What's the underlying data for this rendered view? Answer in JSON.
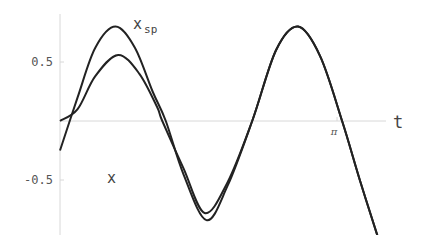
{
  "chart_data": {
    "type": "line",
    "title": "",
    "xlabel": "t",
    "ylabel": "",
    "xlim": [
      0,
      3.6
    ],
    "ylim": [
      -0.9,
      0.85
    ],
    "grid": false,
    "legend": "inline labels",
    "x_ticks": [
      {
        "value": 3.14159,
        "label": "π"
      }
    ],
    "y_ticks": [
      {
        "value": 0.5,
        "label": "0.5"
      },
      {
        "value": -0.5,
        "label": "-0.5"
      }
    ],
    "series": [
      {
        "name": "x_sp",
        "label_main": "x",
        "label_sub": "sp",
        "points": [
          [
            0,
            -0.25
          ],
          [
            0.2,
            0.2
          ],
          [
            0.4,
            0.62
          ],
          [
            0.63,
            0.8
          ],
          [
            0.85,
            0.62
          ],
          [
            1.05,
            0.25
          ],
          [
            1.2,
            0.0
          ],
          [
            1.4,
            -0.45
          ],
          [
            1.66,
            -0.84
          ],
          [
            1.9,
            -0.55
          ],
          [
            2.18,
            0.0
          ],
          [
            2.45,
            0.6
          ],
          [
            2.7,
            0.8
          ],
          [
            2.95,
            0.55
          ],
          [
            3.2,
            0.0
          ],
          [
            3.4,
            -0.5
          ],
          [
            3.6,
            -0.97
          ]
        ]
      },
      {
        "name": "x",
        "label_main": "x",
        "points": [
          [
            0,
            0.0
          ],
          [
            0.2,
            0.1
          ],
          [
            0.4,
            0.38
          ],
          [
            0.66,
            0.56
          ],
          [
            0.9,
            0.4
          ],
          [
            1.1,
            0.12
          ],
          [
            1.16,
            0.0
          ],
          [
            1.4,
            -0.4
          ],
          [
            1.64,
            -0.78
          ],
          [
            1.9,
            -0.52
          ],
          [
            2.18,
            0.0
          ],
          [
            2.45,
            0.6
          ],
          [
            2.7,
            0.8
          ],
          [
            2.95,
            0.55
          ],
          [
            3.2,
            0.0
          ],
          [
            3.4,
            -0.5
          ],
          [
            3.6,
            -0.97
          ]
        ]
      }
    ]
  },
  "axes": {
    "t_label": "t",
    "pi_label": "π",
    "y_tick_pos": "0.5",
    "y_tick_neg": "-0.5"
  },
  "labels": {
    "xsp_main": "x",
    "xsp_sub": "sp",
    "x_main": "x"
  }
}
